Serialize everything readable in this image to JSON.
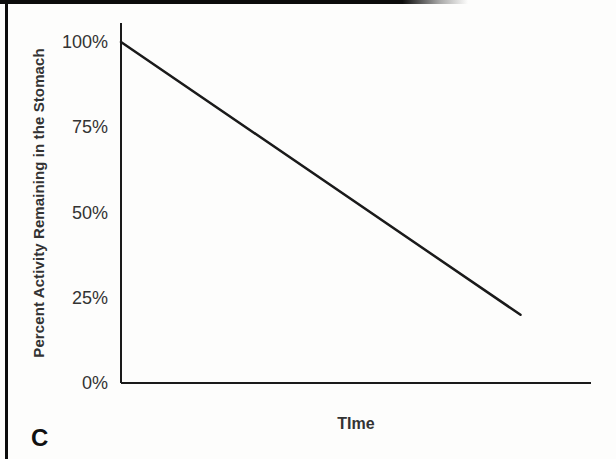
{
  "panel_label": "C",
  "colors": {
    "line": "#1a1a1a",
    "axis": "#1a1a1a",
    "text": "#333333",
    "border": "#0c0c0c",
    "background": "#fdfdfc"
  },
  "chart_data": {
    "type": "line",
    "title": "",
    "xlabel": "TIme",
    "ylabel": "Percent Activity Remaining in the Stomach",
    "ylim": [
      0,
      100
    ],
    "xlim": [
      0,
      1
    ],
    "grid": false,
    "legend": false,
    "yticks": [
      {
        "label": "100%",
        "value": 100
      },
      {
        "label": "75%",
        "value": 75
      },
      {
        "label": "50%",
        "value": 50
      },
      {
        "label": "25%",
        "value": 25
      },
      {
        "label": "0%",
        "value": 0
      }
    ],
    "xticks": [],
    "series": [
      {
        "name": "percent-activity-remaining",
        "color": "#1a1a1a",
        "points": [
          {
            "x": 0,
            "y": 100
          },
          {
            "x": 0.85,
            "y": 20
          }
        ]
      }
    ]
  }
}
